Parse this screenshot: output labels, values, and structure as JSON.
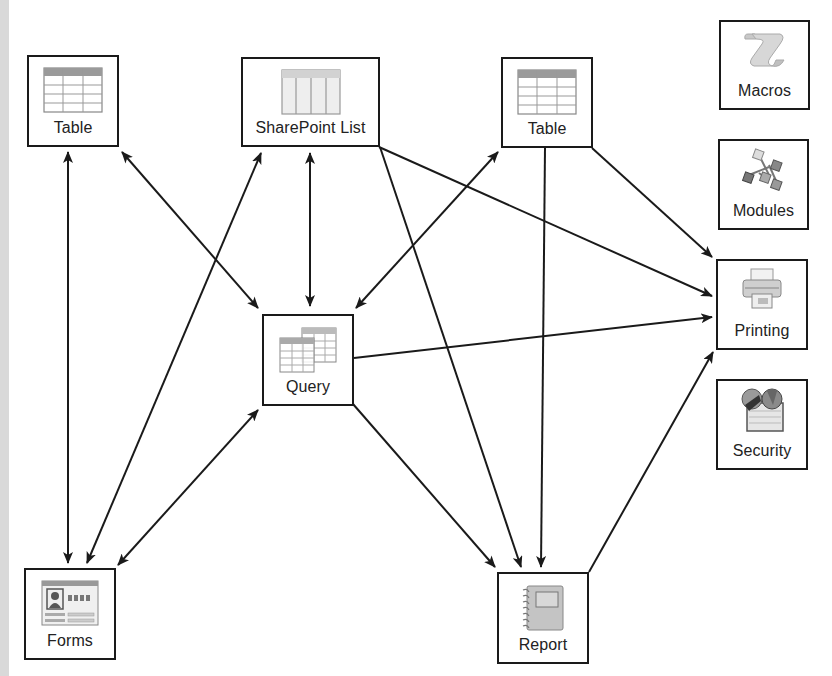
{
  "diagram": {
    "nodes": [
      {
        "id": "table-left",
        "label": "Table",
        "icon": "table-icon"
      },
      {
        "id": "sharepoint-list",
        "label": "SharePoint List",
        "icon": "sharepoint-list-icon"
      },
      {
        "id": "table-right",
        "label": "Table",
        "icon": "table-icon"
      },
      {
        "id": "macros",
        "label": "Macros",
        "icon": "scroll-icon"
      },
      {
        "id": "modules",
        "label": "Modules",
        "icon": "modules-icon"
      },
      {
        "id": "printing",
        "label": "Printing",
        "icon": "printer-icon"
      },
      {
        "id": "security",
        "label": "Security",
        "icon": "security-icon"
      },
      {
        "id": "query",
        "label": "Query",
        "icon": "query-icon"
      },
      {
        "id": "forms",
        "label": "Forms",
        "icon": "form-icon"
      },
      {
        "id": "report",
        "label": "Report",
        "icon": "report-icon"
      }
    ],
    "edges": [
      {
        "from": "table-left",
        "to": "forms",
        "direction": "both"
      },
      {
        "from": "table-left",
        "to": "query",
        "direction": "both"
      },
      {
        "from": "sharepoint-list",
        "to": "forms",
        "direction": "both"
      },
      {
        "from": "sharepoint-list",
        "to": "query",
        "direction": "both"
      },
      {
        "from": "sharepoint-list",
        "to": "printing",
        "direction": "forward"
      },
      {
        "from": "sharepoint-list",
        "to": "report",
        "direction": "forward"
      },
      {
        "from": "table-right",
        "to": "query",
        "direction": "both"
      },
      {
        "from": "table-right",
        "to": "report",
        "direction": "forward"
      },
      {
        "from": "table-right",
        "to": "printing",
        "direction": "forward"
      },
      {
        "from": "query",
        "to": "printing",
        "direction": "forward"
      },
      {
        "from": "query",
        "to": "report",
        "direction": "forward"
      },
      {
        "from": "forms",
        "to": "query",
        "direction": "both"
      },
      {
        "from": "report",
        "to": "printing",
        "direction": "forward"
      }
    ]
  }
}
